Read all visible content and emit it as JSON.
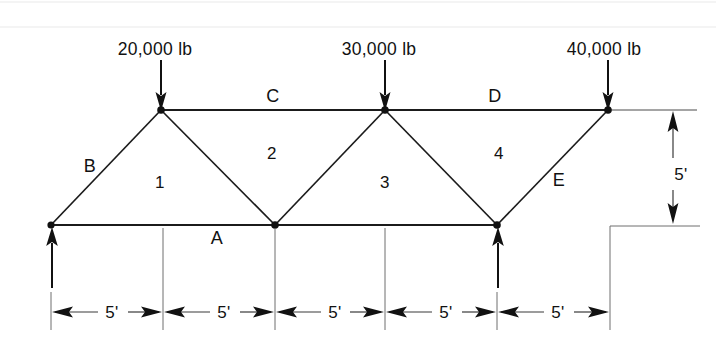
{
  "figure": {
    "type": "engineering-truss-diagram",
    "background_color": "#ffffff",
    "line_color": "#111111"
  },
  "loads": [
    {
      "id": "load-20k",
      "label": "20,000 lb",
      "magnitude": 20000,
      "unit": "lb",
      "direction": "down",
      "at_node": "top-left-joint"
    },
    {
      "id": "load-30k",
      "label": "30,000 lb",
      "magnitude": 30000,
      "unit": "lb",
      "direction": "down",
      "at_node": "top-mid-joint"
    },
    {
      "id": "load-40k",
      "label": "40,000 lb",
      "magnitude": 40000,
      "unit": "lb",
      "direction": "down",
      "at_node": "top-right-joint"
    }
  ],
  "reactions": [
    {
      "id": "reaction-left",
      "label": "",
      "direction": "up",
      "at_node": "bottom-left-support"
    },
    {
      "id": "reaction-right",
      "label": "",
      "direction": "up",
      "at_node": "bottom-right-support"
    }
  ],
  "member_labels": [
    {
      "id": "member-B",
      "label": "B",
      "x": 90,
      "y": 170
    },
    {
      "id": "member-C",
      "label": "C",
      "x": 273,
      "y": 100
    },
    {
      "id": "member-D",
      "label": "D",
      "x": 495,
      "y": 100
    },
    {
      "id": "member-E",
      "label": "E",
      "x": 557,
      "y": 184
    },
    {
      "id": "joint-A",
      "label": "A",
      "x": 215,
      "y": 243
    }
  ],
  "panel_labels": [
    {
      "id": "panel-1",
      "label": "1",
      "x": 160,
      "y": 185
    },
    {
      "id": "panel-2",
      "label": "2",
      "x": 272,
      "y": 157
    },
    {
      "id": "panel-3",
      "label": "3",
      "x": 384,
      "y": 185
    },
    {
      "id": "panel-4",
      "label": "4",
      "x": 498,
      "y": 157
    }
  ],
  "dimensions": {
    "horizontal_unit": "5'",
    "horizontal_spans": [
      "5'",
      "5'",
      "5'",
      "5'",
      "5'"
    ],
    "vertical_height": "5'",
    "span_count": 5
  },
  "geometry": {
    "top_chord_y": 110,
    "bottom_chord_y": 225,
    "nodes": [
      {
        "name": "bottom-left-support",
        "x": 51,
        "y": 225
      },
      {
        "name": "top-left-joint",
        "x": 161,
        "y": 110
      },
      {
        "name": "bottom-mid-joint",
        "x": 275,
        "y": 225
      },
      {
        "name": "top-mid-joint",
        "x": 385,
        "y": 110
      },
      {
        "name": "bottom-right-support",
        "x": 497,
        "y": 225
      },
      {
        "name": "top-right-joint",
        "x": 608,
        "y": 110
      }
    ],
    "dimension_line_y": 312,
    "dimension_ticks_x": [
      51,
      163,
      275,
      385,
      497,
      610
    ],
    "vertical_dim_x": 673
  }
}
